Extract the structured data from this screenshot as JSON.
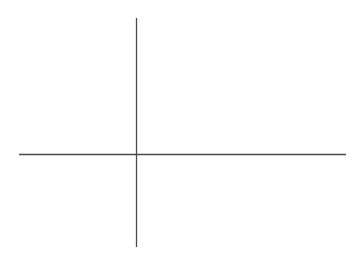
{
  "canvas": {
    "width": "362",
    "height": "272",
    "viewbox": "0 0 362 272",
    "background": "#ffffff"
  },
  "diagram": {
    "line_color": "#4a4a4a",
    "stroke_width": "1.3",
    "vertical_axis": {
      "x1": "136.5",
      "y1": "18",
      "x2": "136.5",
      "y2": "247"
    },
    "horizontal_axis": {
      "x1": "19",
      "y1": "154.5",
      "x2": "346",
      "y2": "154.5"
    }
  }
}
